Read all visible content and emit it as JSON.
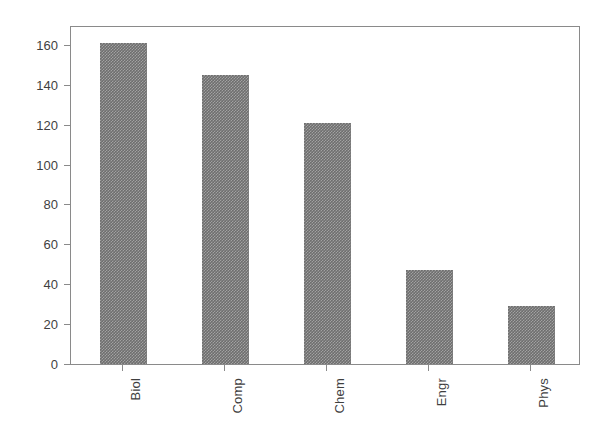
{
  "chart_data": {
    "type": "bar",
    "title": "",
    "xlabel": "",
    "ylabel": "",
    "categories": [
      "Biol",
      "Comp",
      "Chem",
      "Engr",
      "Phys"
    ],
    "values": [
      161,
      145,
      121,
      47,
      29
    ],
    "ylim": [
      0,
      170
    ],
    "yticks": [
      0,
      20,
      40,
      60,
      80,
      100,
      120,
      140,
      160
    ],
    "ytick_labels": [
      "0",
      "20",
      "40",
      "60",
      "80",
      "100",
      "120",
      "140",
      "160"
    ],
    "grid": false,
    "legend": null,
    "bar_color": "#6e6e6e",
    "bar_pattern": "checkered-dither",
    "axes_color": "#8a8a8a",
    "background_color": "#ffffff",
    "xtick_label_rotation": 90
  },
  "axis": {
    "y_axis_name": "y-axis",
    "x_axis_name": "x-axis"
  }
}
